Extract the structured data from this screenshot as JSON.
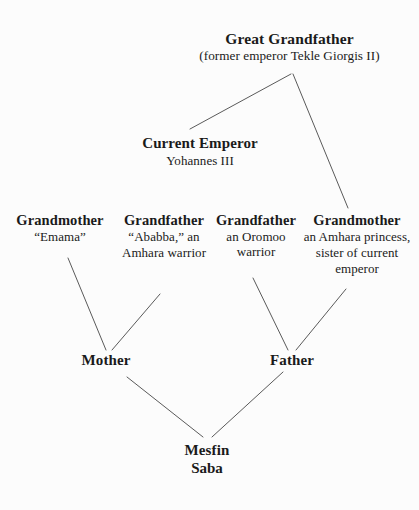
{
  "diagram": {
    "type": "family-tree",
    "background_color": "#fcfcfc",
    "line_color": "#5a5a5a",
    "text_color": "#1a1a1a",
    "nodes": {
      "great_grandfather": {
        "title": "Great Grandfather",
        "subtitle": "(former emperor Tekle Giorgis II)"
      },
      "current_emperor": {
        "title": "Current Emperor",
        "subtitle": "Yohannes III"
      },
      "grandmother_maternal": {
        "title": "Grandmother",
        "subtitle": "“Emama”"
      },
      "grandfather_maternal": {
        "title": "Grandfather",
        "subtitle": "“Ababba,” an Amhara warrior"
      },
      "grandfather_paternal": {
        "title": "Grandfather",
        "subtitle": "an Oromoo warrior"
      },
      "grandmother_paternal": {
        "title": "Grandmother",
        "subtitle": "an Amhara princess, sister of current emperor"
      },
      "mother": {
        "title": "Mother"
      },
      "father": {
        "title": "Father"
      },
      "child": {
        "title": "Mesfin",
        "title2": "Saba"
      }
    },
    "edges": [
      {
        "from": "great_grandfather",
        "to": "current_emperor"
      },
      {
        "from": "great_grandfather",
        "to": "grandmother_paternal"
      },
      {
        "from": "grandmother_maternal",
        "to": "mother"
      },
      {
        "from": "grandfather_maternal",
        "to": "mother"
      },
      {
        "from": "grandfather_paternal",
        "to": "father"
      },
      {
        "from": "grandmother_paternal",
        "to": "father"
      },
      {
        "from": "mother",
        "to": "child"
      },
      {
        "from": "father",
        "to": "child"
      }
    ]
  }
}
